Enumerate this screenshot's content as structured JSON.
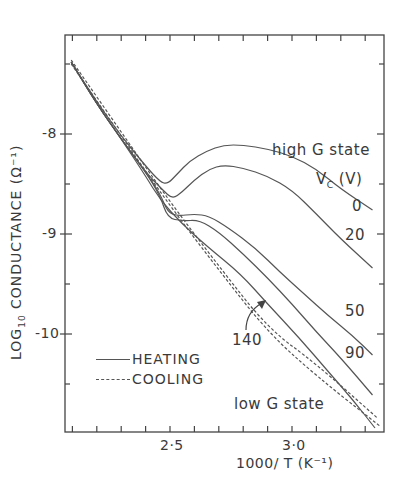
{
  "chart_data": {
    "type": "line",
    "title": "",
    "xlabel": "1000/T (K⁻¹)",
    "ylabel": "LOG10 CONDUCTANCE (Ω⁻¹)",
    "xlim": [
      2.07,
      3.38
    ],
    "ylim": [
      -10.98,
      -7.0
    ],
    "x_ticks": [
      2.5,
      3.0
    ],
    "x_tick_labels": [
      "2·5",
      "3·0"
    ],
    "y_ticks": [
      -8,
      -9,
      -10
    ],
    "y_tick_labels": [
      "-8",
      "-9",
      "-10"
    ],
    "grid": false,
    "legend": {
      "position": "lower-left-inside",
      "entries": [
        {
          "label": "HEATING",
          "style": "solid"
        },
        {
          "label": "COOLING",
          "style": "dashed"
        }
      ]
    },
    "annotations": [
      {
        "text": "high G state",
        "x": 3.2,
        "y": -7.78
      },
      {
        "text": "V_C (V)",
        "x": 3.22,
        "y": -8.12
      },
      {
        "text": "low G state",
        "x": 3.1,
        "y": -10.75
      },
      {
        "text": "140",
        "x": 2.78,
        "y": -10.0,
        "arrow_to": [
          2.84,
          -9.55
        ]
      }
    ],
    "series": [
      {
        "name": "V_C = 0 V (heating)",
        "style": "solid",
        "label": "0",
        "points": [
          [
            2.095,
            -7.28
          ],
          [
            2.2,
            -7.68
          ],
          [
            2.3,
            -8.02
          ],
          [
            2.4,
            -8.32
          ],
          [
            2.46,
            -8.48
          ],
          [
            2.49,
            -8.5
          ],
          [
            2.53,
            -8.4
          ],
          [
            2.58,
            -8.27
          ],
          [
            2.65,
            -8.17
          ],
          [
            2.72,
            -8.11
          ],
          [
            2.8,
            -8.11
          ],
          [
            2.9,
            -8.15
          ],
          [
            3.0,
            -8.22
          ],
          [
            3.1,
            -8.35
          ],
          [
            3.2,
            -8.55
          ],
          [
            3.33,
            -8.76
          ]
        ]
      },
      {
        "name": "V_C = 20 V (heating)",
        "style": "solid",
        "label": "20",
        "points": [
          [
            2.095,
            -7.28
          ],
          [
            2.2,
            -7.7
          ],
          [
            2.3,
            -8.05
          ],
          [
            2.4,
            -8.38
          ],
          [
            2.47,
            -8.56
          ],
          [
            2.51,
            -8.65
          ],
          [
            2.55,
            -8.58
          ],
          [
            2.6,
            -8.46
          ],
          [
            2.66,
            -8.35
          ],
          [
            2.72,
            -8.31
          ],
          [
            2.8,
            -8.34
          ],
          [
            2.9,
            -8.42
          ],
          [
            3.0,
            -8.56
          ],
          [
            3.1,
            -8.8
          ],
          [
            3.2,
            -9.05
          ],
          [
            3.33,
            -9.34
          ]
        ]
      },
      {
        "name": "V_C = 50 V (heating)",
        "style": "solid",
        "label": "50",
        "points": [
          [
            2.095,
            -7.28
          ],
          [
            2.2,
            -7.7
          ],
          [
            2.3,
            -8.05
          ],
          [
            2.4,
            -8.38
          ],
          [
            2.46,
            -8.6
          ],
          [
            2.49,
            -8.78
          ],
          [
            2.53,
            -8.82
          ],
          [
            2.6,
            -8.8
          ],
          [
            2.66,
            -8.82
          ],
          [
            2.74,
            -8.94
          ],
          [
            2.85,
            -9.14
          ],
          [
            2.95,
            -9.38
          ],
          [
            3.05,
            -9.6
          ],
          [
            3.15,
            -9.82
          ],
          [
            3.25,
            -10.02
          ],
          [
            3.33,
            -10.21
          ]
        ]
      },
      {
        "name": "V_C = 90 V (heating)",
        "style": "solid",
        "label": "90",
        "points": [
          [
            2.095,
            -7.28
          ],
          [
            2.2,
            -7.7
          ],
          [
            2.3,
            -8.05
          ],
          [
            2.4,
            -8.38
          ],
          [
            2.46,
            -8.62
          ],
          [
            2.49,
            -8.84
          ],
          [
            2.55,
            -8.87
          ],
          [
            2.62,
            -8.86
          ],
          [
            2.7,
            -8.98
          ],
          [
            2.8,
            -9.2
          ],
          [
            2.9,
            -9.44
          ],
          [
            3.0,
            -9.7
          ],
          [
            3.1,
            -9.98
          ],
          [
            3.2,
            -10.24
          ],
          [
            3.33,
            -10.61
          ]
        ]
      },
      {
        "name": "V_C = 140 V (heating)",
        "style": "solid",
        "label": "140",
        "points": [
          [
            2.095,
            -7.28
          ],
          [
            2.2,
            -7.7
          ],
          [
            2.3,
            -8.05
          ],
          [
            2.4,
            -8.42
          ],
          [
            2.46,
            -8.66
          ],
          [
            2.55,
            -8.9
          ],
          [
            2.65,
            -9.12
          ],
          [
            2.79,
            -9.4
          ],
          [
            2.9,
            -9.7
          ],
          [
            3.03,
            -10.04
          ],
          [
            3.15,
            -10.38
          ],
          [
            3.25,
            -10.66
          ],
          [
            3.34,
            -10.94
          ]
        ]
      },
      {
        "name": "Cooling A",
        "style": "dashed",
        "points": [
          [
            2.095,
            -7.26
          ],
          [
            2.3,
            -7.98
          ],
          [
            2.5,
            -8.68
          ],
          [
            2.7,
            -9.32
          ],
          [
            2.9,
            -9.94
          ],
          [
            3.1,
            -10.3
          ],
          [
            3.35,
            -10.84
          ]
        ]
      },
      {
        "name": "Cooling B",
        "style": "dashed",
        "points": [
          [
            2.095,
            -7.3
          ],
          [
            2.3,
            -8.02
          ],
          [
            2.5,
            -8.72
          ],
          [
            2.7,
            -9.36
          ],
          [
            2.9,
            -9.98
          ],
          [
            3.1,
            -10.42
          ],
          [
            3.36,
            -10.92
          ]
        ]
      }
    ]
  },
  "labels": {
    "high_g_state": "high G state",
    "vc_prefix": "V",
    "vc_sub": "C",
    "vc_unit": " (V)",
    "low_g_state": "low G state",
    "v0": "0",
    "v20": "20",
    "v50": "50",
    "v90": "90",
    "v140": "140",
    "ylabel_log": "LOG",
    "ylabel_sub": "10",
    "ylabel_rest": " CONDUCTANCE  (Ω⁻¹)",
    "xlabel": "1000/ T  (K⁻¹)",
    "xtick_25": "2·5",
    "xtick_30": "3·0",
    "ytick_8": "-8",
    "ytick_9": "-9",
    "ytick_10": "-10",
    "legend_heating": "HEATING",
    "legend_cooling": "COOLING"
  },
  "colors": {
    "ink": "#555555",
    "axis": "#444444",
    "background": "#ffffff"
  }
}
